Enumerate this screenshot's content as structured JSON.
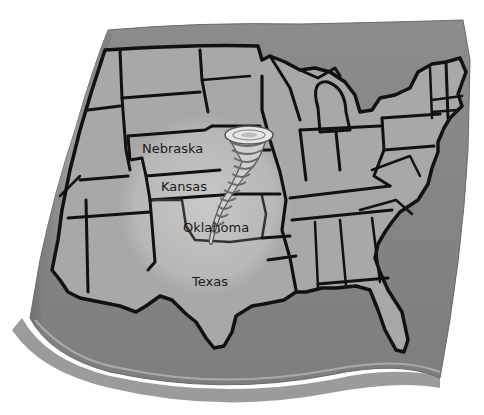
{
  "map": {
    "subject": "United States map with tornado over central plains",
    "colors": {
      "background": "#ffffff",
      "paper_edge": "#8a8a8a",
      "ocean": "#8f8f8f",
      "land": "#a9a9a9",
      "land_light": "#b8b8b8",
      "highlight": "#c6c6c6",
      "border": "#111111",
      "shadow": "#5a5a5a",
      "tornado_light": "#e8e8e8",
      "tornado_dark": "#6a6a6a"
    },
    "labels": [
      {
        "id": "nebraska",
        "text": "Nebraska",
        "x": 142,
        "y": 141
      },
      {
        "id": "kansas",
        "text": "Kansas",
        "x": 161,
        "y": 179
      },
      {
        "id": "oklahoma",
        "text": "Oklahoma",
        "x": 183,
        "y": 220
      },
      {
        "id": "texas",
        "text": "Texas",
        "x": 192,
        "y": 274
      }
    ],
    "icons": {
      "tornado": "tornado-icon"
    }
  }
}
